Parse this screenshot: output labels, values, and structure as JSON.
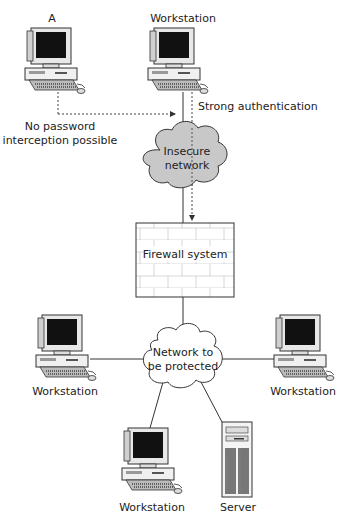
{
  "diagram": {
    "nodes": {
      "workstation_a": {
        "label": "A",
        "type": "workstation"
      },
      "workstation_top": {
        "label": "Workstation",
        "type": "workstation"
      },
      "insecure_network": {
        "label_line1": "Insecure",
        "label_line2": "network",
        "type": "cloud",
        "fill": "#c8c8c8"
      },
      "firewall": {
        "label": "Firewall system",
        "type": "firewall"
      },
      "protected_network": {
        "label_line1": "Network to",
        "label_line2": "be protected",
        "type": "cloud",
        "fill": "#ffffff"
      },
      "workstation_left": {
        "label": "Workstation",
        "type": "workstation"
      },
      "workstation_right": {
        "label": "Workstation",
        "type": "workstation"
      },
      "workstation_bottom": {
        "label": "Workstation",
        "type": "workstation"
      },
      "server": {
        "label": "Server",
        "type": "server"
      }
    },
    "annotations": {
      "no_password_line1": "No password",
      "no_password_line2": "interception possible",
      "strong_auth": "Strong authentication"
    },
    "edges": [
      {
        "from": "workstation_a",
        "to": "workstation_top",
        "style": "dotted-arrow"
      },
      {
        "from": "workstation_top",
        "to": "insecure_network",
        "style": "solid"
      },
      {
        "from": "workstation_top",
        "to": "firewall",
        "style": "dotted-arrow"
      },
      {
        "from": "insecure_network",
        "to": "firewall",
        "style": "solid"
      },
      {
        "from": "firewall",
        "to": "protected_network",
        "style": "solid"
      },
      {
        "from": "protected_network",
        "to": "workstation_left",
        "style": "solid"
      },
      {
        "from": "protected_network",
        "to": "workstation_right",
        "style": "solid"
      },
      {
        "from": "protected_network",
        "to": "workstation_bottom",
        "style": "solid"
      },
      {
        "from": "protected_network",
        "to": "server",
        "style": "solid"
      }
    ]
  }
}
